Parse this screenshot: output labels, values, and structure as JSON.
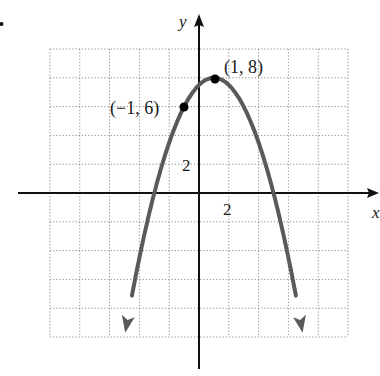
{
  "chart_data": {
    "type": "line",
    "title": "",
    "xlabel": "x",
    "ylabel": "y",
    "function": "y = 8 - 0.5(x - 1)^2",
    "xlim": [
      -10,
      10
    ],
    "ylim": [
      -10,
      10
    ],
    "grid": true,
    "grid_step": 2,
    "x_tick_labels": [
      {
        "value": 2,
        "label": "2"
      }
    ],
    "y_tick_labels": [
      {
        "value": 2,
        "label": "2"
      }
    ],
    "series": [
      {
        "name": "parabola",
        "color": "#5a5a5a",
        "arrows_at_ends": true,
        "x": [
          -4.95,
          -4,
          -3,
          -2,
          -1,
          0,
          1,
          2,
          3,
          4,
          5,
          6,
          6.95
        ],
        "y": [
          -9.7,
          -4.5,
          0,
          3.5,
          6,
          7.5,
          8,
          7.5,
          6,
          3.5,
          0,
          -4.5,
          -9.7
        ]
      }
    ],
    "points": [
      {
        "x": -1,
        "y": 6,
        "label": "(−1, 6)"
      },
      {
        "x": 1,
        "y": 8,
        "label": "(1, 8)"
      }
    ],
    "annotations": [
      "(−1, 6)",
      "(1, 8)"
    ]
  },
  "labels": {
    "x_axis": "x",
    "y_axis": "y",
    "x_tick": "2",
    "y_tick": "2",
    "point_a": "(−1, 6)",
    "point_b": "(1, 8)"
  },
  "colors": {
    "curve": "#5a5a5a",
    "axis": "#111111",
    "grid": "#8a8a8a",
    "point": "#000000"
  }
}
